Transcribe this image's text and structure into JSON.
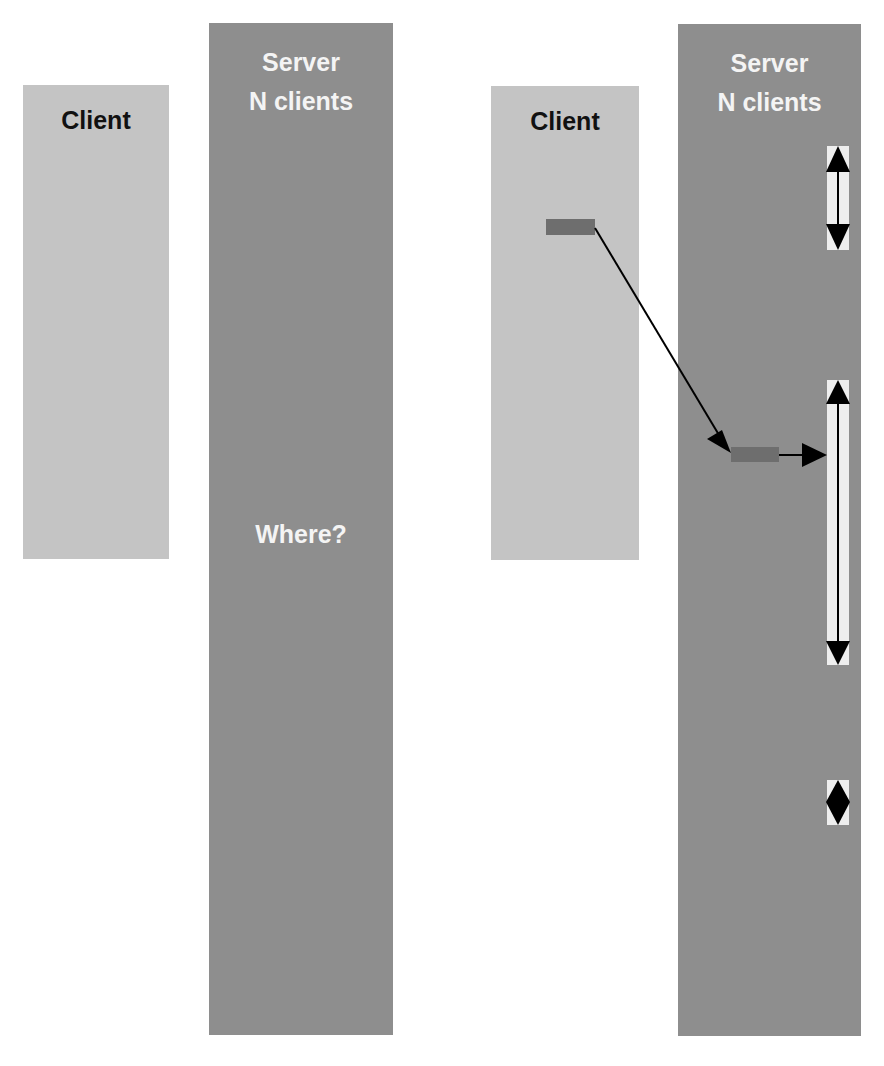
{
  "colors": {
    "background": "#ffffff",
    "client_fill": "#c4c4c4",
    "server_fill": "#8e8e8e",
    "request_block": "#6e6e6e",
    "range_bar": "#eeeeee",
    "arrow": "#000000"
  },
  "left_panel": {
    "client": {
      "label": "Client"
    },
    "server": {
      "label_line1": "Server",
      "label_line2": "N clients",
      "question": "Where?"
    }
  },
  "right_panel": {
    "client": {
      "label": "Client"
    },
    "server": {
      "label_line1": "Server",
      "label_line2": "N clients"
    },
    "request_block": "client-request",
    "server_block": "server-placement",
    "range_bars": [
      {
        "name": "free-range-1",
        "icon": "double-arrow-icon"
      },
      {
        "name": "free-range-2",
        "icon": "double-arrow-icon"
      },
      {
        "name": "free-range-3",
        "icon": "diamond-arrow-icon"
      }
    ]
  }
}
